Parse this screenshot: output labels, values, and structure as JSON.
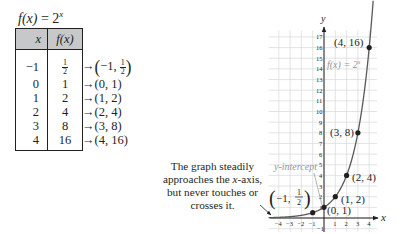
{
  "function_title": {
    "lhs": "f(x)",
    "equals": "=",
    "base": "2",
    "exponent": "x"
  },
  "table": {
    "headers": {
      "x": "x",
      "fx": "f(x)"
    },
    "rows": [
      {
        "x": "−1",
        "fx": "1/2",
        "fx_num": "1",
        "fx_den": "2",
        "point": "(−1, 1/2)",
        "point_x": "−1",
        "point_num": "1",
        "point_den": "2"
      },
      {
        "x": "0",
        "fx": "1",
        "point": "(0, 1)"
      },
      {
        "x": "1",
        "fx": "2",
        "point": "(1, 2)"
      },
      {
        "x": "2",
        "fx": "4",
        "point": "(2, 4)"
      },
      {
        "x": "3",
        "fx": "8",
        "point": "(3, 8)"
      },
      {
        "x": "4",
        "fx": "16",
        "point": "(4, 16)"
      }
    ],
    "arrow_symbol": "→",
    "header_fill": "#c7c8ca"
  },
  "annotation": {
    "line1": "The graph steadily",
    "line2_pre": "approaches the ",
    "line2_var": "x",
    "line2_post": "-axis,",
    "line3": "but never touches or",
    "line4": "crosses it."
  },
  "chart_data": {
    "type": "line",
    "xlabel": "x",
    "ylabel": "y",
    "xlim": [
      -4.5,
      4.5
    ],
    "ylim": [
      -1,
      17.5
    ],
    "x_ticks": [
      -4,
      -3,
      -2,
      -1,
      1,
      2,
      3,
      4
    ],
    "y_ticks": [
      -1,
      1,
      2,
      3,
      4,
      5,
      6,
      7,
      8,
      9,
      10,
      11,
      12,
      13,
      14,
      15,
      16,
      17
    ],
    "grid": true,
    "series": [
      {
        "name": "f(x) = 2^x",
        "x": [
          -4,
          -3,
          -2,
          -1,
          0,
          1,
          2,
          3,
          4
        ],
        "y": [
          0.0625,
          0.125,
          0.25,
          0.5,
          1,
          2,
          4,
          8,
          16
        ]
      }
    ],
    "points": [
      {
        "x": -1,
        "y": 0.5,
        "label": "(−1, 1/2)"
      },
      {
        "x": 0,
        "y": 1,
        "label": "(0, 1)"
      },
      {
        "x": 1,
        "y": 2,
        "label": "(1, 2)"
      },
      {
        "x": 2,
        "y": 4,
        "label": "(2, 4)"
      },
      {
        "x": 3,
        "y": 8,
        "label": "(3, 8)"
      },
      {
        "x": 4,
        "y": 16,
        "label": "(4, 16)"
      }
    ],
    "annotations": [
      "y-intercept",
      "f(x) = 2^x"
    ],
    "curve_label": "f(x) = 2",
    "curve_label_exp": "x",
    "y_intercept_label": "y-intercept",
    "grid_color": "#d9d9db",
    "curve_color": "#58595b",
    "label_gray": "#939598"
  }
}
